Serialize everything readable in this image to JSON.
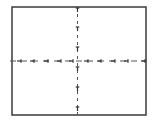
{
  "diagram": {
    "type": "frame-with-crosshair",
    "frame": {
      "x": 12,
      "y": 7,
      "width": 134,
      "height": 108,
      "stroke": "#3a3a3a",
      "stroke_width": 1.5
    },
    "vertical_axis": {
      "x": 77.5,
      "y1": 7,
      "y2": 115,
      "style": "dashed",
      "color": "#555555"
    },
    "horizontal_axis": {
      "y": 61,
      "x1": 10,
      "x2": 147,
      "style": "dashed",
      "color": "#555555"
    },
    "vertical_ticks_y": [
      8,
      27,
      47,
      67,
      87,
      107
    ],
    "horizontal_ticks_x": [
      21,
      34,
      48,
      61,
      73,
      88,
      101,
      115,
      128,
      145
    ],
    "labels": []
  }
}
